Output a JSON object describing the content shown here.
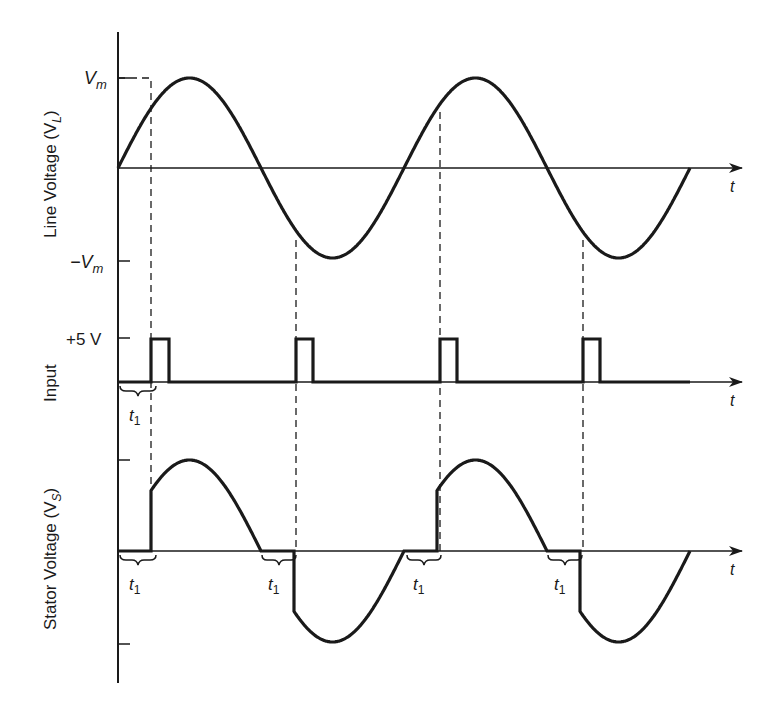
{
  "figure": {
    "colors": {
      "ink": "#1a1a1a",
      "background": "#ffffff"
    },
    "time_axis_label": "t",
    "panels": [
      {
        "id": "line-voltage",
        "ylabel": "Line Voltage (V",
        "ylabel_sub": "L",
        "ylabel_close": ")",
        "ticks": [
          {
            "label": "V",
            "sub": "m",
            "level": "max"
          },
          {
            "label": "−V",
            "sub": "m",
            "level": "min"
          }
        ],
        "waveform": "sine",
        "cycles": 2
      },
      {
        "id": "input",
        "ylabel": "Input",
        "ticks": [
          {
            "label": "+5 V",
            "level": "high"
          }
        ],
        "waveform": "pulse-train",
        "pulses": 4,
        "delay_label": "t",
        "delay_sub": "1"
      },
      {
        "id": "stator-voltage",
        "ylabel": "Stator Voltage (V",
        "ylabel_sub": "S",
        "ylabel_close": ")",
        "ticks": [
          {
            "label": "",
            "level": "max"
          },
          {
            "label": "",
            "level": "min"
          }
        ],
        "waveform": "phase-controlled sine",
        "delay_labels": [
          {
            "t": "t",
            "sub": "1"
          },
          {
            "t": "t",
            "sub": "1"
          },
          {
            "t": "t",
            "sub": "1"
          },
          {
            "t": "t",
            "sub": "1"
          }
        ]
      }
    ]
  }
}
